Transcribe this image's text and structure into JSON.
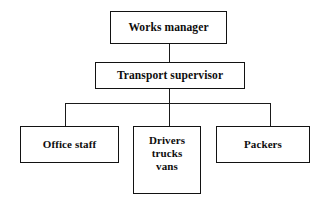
{
  "chart_data": {
    "type": "diagram",
    "diagram_type": "organizational-chart",
    "title": "",
    "orientation": "top-down",
    "levels": 3,
    "nodes": [
      {
        "id": "works-manager",
        "label": "Works manager",
        "level": 1,
        "parent": null
      },
      {
        "id": "transport-supervisor",
        "label": "Transport supervisor",
        "level": 2,
        "parent": "works-manager"
      },
      {
        "id": "office-staff",
        "label": "Office staff",
        "level": 3,
        "parent": "transport-supervisor"
      },
      {
        "id": "drivers",
        "label": "Drivers trucks vans",
        "level": 3,
        "parent": "transport-supervisor"
      },
      {
        "id": "packers",
        "label": "Packers",
        "level": 3,
        "parent": "transport-supervisor"
      }
    ],
    "edges": [
      {
        "from": "works-manager",
        "to": "transport-supervisor"
      },
      {
        "from": "transport-supervisor",
        "to": "office-staff"
      },
      {
        "from": "transport-supervisor",
        "to": "drivers"
      },
      {
        "from": "transport-supervisor",
        "to": "packers"
      }
    ]
  },
  "chart": {
    "nodes": {
      "works_manager": {
        "label": "Works manager"
      },
      "transport_supervisor": {
        "label": "Transport supervisor"
      },
      "office_staff": {
        "label": "Office staff"
      },
      "drivers": {
        "line1": "Drivers",
        "line2": "trucks",
        "line3": "vans"
      },
      "packers": {
        "label": "Packers"
      }
    }
  },
  "colors": {
    "background": "#ffffff",
    "box_border": "#121212",
    "box_fill": "#ffffff",
    "text": "#0d0d0d",
    "connector": "#1a1a1a"
  }
}
